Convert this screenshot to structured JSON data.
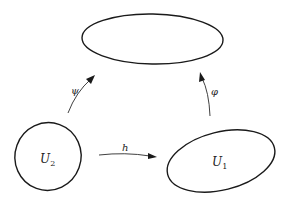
{
  "diagram": {
    "type": "commutative-diagram",
    "colors": {
      "stroke": "#1a1a1a",
      "background": "#ffffff"
    },
    "nodes": [
      {
        "id": "target",
        "label": "",
        "shape": "ellipse"
      },
      {
        "id": "U2",
        "label": "U",
        "subscript": "2",
        "shape": "ellipse"
      },
      {
        "id": "U1",
        "label": "U",
        "subscript": "1",
        "shape": "ellipse"
      }
    ],
    "edges": [
      {
        "id": "psi",
        "from": "U2",
        "to": "target",
        "label": "ψ"
      },
      {
        "id": "phi",
        "from": "U1",
        "to": "target",
        "label": "φ"
      },
      {
        "id": "h",
        "from": "U2",
        "to": "U1",
        "label": "h"
      }
    ]
  }
}
